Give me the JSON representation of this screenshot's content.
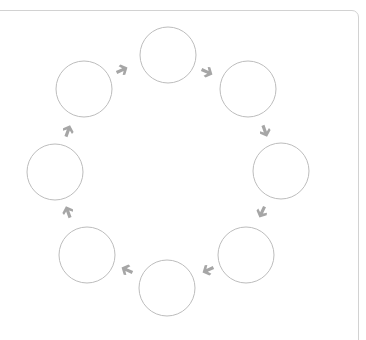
{
  "diagram": {
    "type": "cycle",
    "node_count": 8,
    "colors": {
      "panel_border": "#d2d2d2",
      "node_stroke": "#bdbdbd",
      "arrow": "#a6a6a6",
      "background": "#ffffff"
    },
    "nodes": [
      {
        "id": "top",
        "cx": 168,
        "cy": 55,
        "r": 28,
        "label": ""
      },
      {
        "id": "top-right",
        "cx": 248,
        "cy": 89,
        "r": 28,
        "label": ""
      },
      {
        "id": "right",
        "cx": 281,
        "cy": 171,
        "r": 28,
        "label": ""
      },
      {
        "id": "bottom-right",
        "cx": 246,
        "cy": 255,
        "r": 28,
        "label": ""
      },
      {
        "id": "bottom",
        "cx": 167,
        "cy": 288,
        "r": 28,
        "label": ""
      },
      {
        "id": "bottom-left",
        "cx": 87,
        "cy": 255,
        "r": 28,
        "label": ""
      },
      {
        "id": "left",
        "cx": 55,
        "cy": 172,
        "r": 28,
        "label": ""
      },
      {
        "id": "top-left",
        "cx": 84,
        "cy": 89,
        "r": 28,
        "label": ""
      }
    ],
    "arrows": [
      {
        "from": "top-left",
        "to": "top",
        "x": 122,
        "y": 70,
        "angle": -25
      },
      {
        "from": "top",
        "to": "top-right",
        "x": 207,
        "y": 72,
        "angle": 25
      },
      {
        "from": "top-right",
        "to": "right",
        "x": 265,
        "y": 131,
        "angle": 70
      },
      {
        "from": "right",
        "to": "bottom-right",
        "x": 262,
        "y": 212,
        "angle": 115
      },
      {
        "from": "bottom-right",
        "to": "bottom",
        "x": 208,
        "y": 270,
        "angle": 155
      },
      {
        "from": "bottom",
        "to": "bottom-left",
        "x": 127,
        "y": 270,
        "angle": 205
      },
      {
        "from": "bottom-left",
        "to": "left",
        "x": 68,
        "y": 212,
        "angle": 250
      },
      {
        "from": "left",
        "to": "top-left",
        "x": 68,
        "y": 131,
        "angle": 290
      }
    ]
  }
}
